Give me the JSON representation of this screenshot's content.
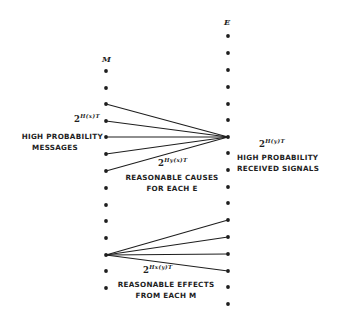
{
  "diagram": {
    "columns": {
      "M": {
        "label": "M",
        "x": 106,
        "dot_y": [
          71,
          88,
          104,
          121,
          137,
          154,
          171,
          188,
          205,
          221,
          238,
          255,
          271,
          288
        ]
      },
      "E": {
        "label": "E",
        "x": 228,
        "dot_y": [
          36,
          53,
          70,
          87,
          104,
          120,
          137,
          153,
          170,
          187,
          203,
          220,
          237,
          254,
          271,
          287,
          304
        ]
      }
    },
    "fans": [
      {
        "name": "causes-fan",
        "target": "E",
        "target_y": 137,
        "from": "M",
        "from_y": [
          104,
          121,
          137,
          154,
          171
        ]
      },
      {
        "name": "effects-fan",
        "source": "M",
        "source_y": 255,
        "to": "E",
        "to_y": [
          220,
          237,
          254,
          271
        ]
      }
    ],
    "labels": {
      "messages_count_base": "2",
      "messages_count_exp": "H(x)T",
      "messages_line1": "HIGH PROBABILITY",
      "messages_line2": "MESSAGES",
      "signals_count_base": "2",
      "signals_count_exp": "H(y)T",
      "signals_line1": "HIGH PROBABILITY",
      "signals_line2": "RECEIVED SIGNALS",
      "causes_count_base": "2",
      "causes_count_exp": "Hy(x)T",
      "causes_line1": "REASONABLE CAUSES",
      "causes_line2": "FOR EACH E",
      "effects_count_base": "2",
      "effects_count_exp": "Hx(y)T",
      "effects_line1": "REASONABLE EFFECTS",
      "effects_line2": "FROM EACH M"
    },
    "colors": {
      "ink": "#1e1e1e",
      "background": "#ffffff"
    }
  }
}
